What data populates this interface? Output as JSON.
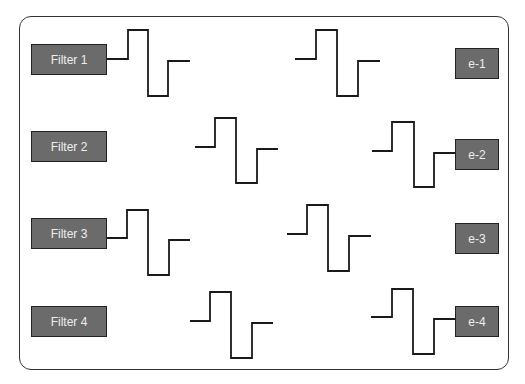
{
  "filters": [
    {
      "label": "Filter 1",
      "x": 31,
      "y": 44,
      "w": 76,
      "h": 31
    },
    {
      "label": "Filter 2",
      "x": 31,
      "y": 131,
      "w": 76,
      "h": 31
    },
    {
      "label": "Filter 3",
      "x": 31,
      "y": 218,
      "w": 76,
      "h": 31
    },
    {
      "label": "Filter 4",
      "x": 31,
      "y": 306,
      "w": 76,
      "h": 31
    }
  ],
  "outputs": [
    {
      "label": "e-1",
      "x": 455,
      "y": 48,
      "w": 44,
      "h": 31
    },
    {
      "label": "e-2",
      "x": 455,
      "y": 139,
      "w": 44,
      "h": 31
    },
    {
      "label": "e-3",
      "x": 455,
      "y": 223,
      "w": 44,
      "h": 31
    },
    {
      "label": "e-4",
      "x": 455,
      "y": 306,
      "w": 44,
      "h": 31
    }
  ],
  "waveforms": [
    {
      "name": "pulse-row1-left",
      "points": "107,59 128,59 128,30 148,30 148,96 168,96 168,61 190,61"
    },
    {
      "name": "pulse-row1-right",
      "points": "295,59 316,59 316,30 337,30 337,96 358,96 358,61 380,61"
    },
    {
      "name": "pulse-row2-mid",
      "points": "195,147 215,147 215,118 236,118 236,183 257,183 257,149 278,149"
    },
    {
      "name": "pulse-row2-right",
      "points": "372,151 392,151 392,122 414,122 414,187 434,187 434,153 455,153"
    },
    {
      "name": "pulse-row3-left",
      "points": "107,238 127,238 127,210 148,210 148,275 169,275 169,240 190,240"
    },
    {
      "name": "pulse-row3-mid",
      "points": "287,234 307,234 307,205 328,205 328,271 349,271 349,236 371,236"
    },
    {
      "name": "pulse-row4-mid",
      "points": "190,321 210,321 210,292 231,292 231,358 252,358 252,323 273,323"
    },
    {
      "name": "pulse-row4-right",
      "points": "371,317 392,317 392,289 413,289 413,354 434,354 434,319 455,319"
    }
  ],
  "colors": {
    "box_fill": "#6b6b6b",
    "box_text": "#eeeeee",
    "line": "#1a1a1a"
  }
}
